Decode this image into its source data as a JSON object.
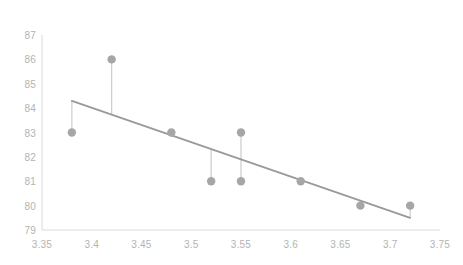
{
  "chart_data": {
    "type": "scatter",
    "title": "",
    "subtitle": "",
    "xlabel": "",
    "ylabel": "",
    "xlim": [
      3.35,
      3.75
    ],
    "ylim": [
      79,
      87
    ],
    "xticks": [
      "3.35",
      "3.4",
      "3.45",
      "3.5",
      "3.55",
      "3.6",
      "3.65",
      "3.7",
      "3.75"
    ],
    "xtick_values": [
      3.35,
      3.4,
      3.45,
      3.5,
      3.55,
      3.6,
      3.65,
      3.7,
      3.75
    ],
    "yticks": [
      "87",
      "86",
      "85",
      "84",
      "83",
      "82",
      "81",
      "80",
      "79"
    ],
    "ytick_values": [
      87,
      86,
      85,
      84,
      83,
      82,
      81,
      80,
      79
    ],
    "grid": false,
    "legend": "none",
    "series": [
      {
        "name": "data-points",
        "marker": "circle",
        "color": "#a6a6a6",
        "x": [
          3.38,
          3.42,
          3.48,
          3.52,
          3.55,
          3.55,
          3.61,
          3.67,
          3.72
        ],
        "y": [
          83,
          86,
          83,
          81,
          83,
          81,
          81,
          80,
          80
        ],
        "points": [
          {
            "x": 3.38,
            "y": 83
          },
          {
            "x": 3.42,
            "y": 86
          },
          {
            "x": 3.48,
            "y": 83
          },
          {
            "x": 3.52,
            "y": 81
          },
          {
            "x": 3.55,
            "y": 83
          },
          {
            "x": 3.55,
            "y": 81
          },
          {
            "x": 3.61,
            "y": 81
          },
          {
            "x": 3.67,
            "y": 80
          },
          {
            "x": 3.72,
            "y": 80
          }
        ]
      }
    ],
    "trendline": {
      "name": "linear-trendline",
      "type": "line",
      "color": "#999999",
      "x": [
        3.38,
        3.72
      ],
      "y": [
        84.3,
        79.5
      ],
      "slope": -14.12,
      "intercept": 131.99
    },
    "residual_lines": {
      "name": "residual-drop-lines",
      "color": "#cccccc",
      "segments": [
        {
          "x": 3.38,
          "y_point": 83,
          "y_fit": 84.3
        },
        {
          "x": 3.42,
          "y_point": 86,
          "y_fit": 83.73
        },
        {
          "x": 3.48,
          "y_point": 83,
          "y_fit": 82.89
        },
        {
          "x": 3.52,
          "y_point": 81,
          "y_fit": 82.32
        },
        {
          "x": 3.55,
          "y_point": 83,
          "y_fit": 81.9
        },
        {
          "x": 3.55,
          "y_point": 81,
          "y_fit": 81.9
        },
        {
          "x": 3.61,
          "y_point": 81,
          "y_fit": 81.05
        },
        {
          "x": 3.67,
          "y_point": 80,
          "y_fit": 80.21
        },
        {
          "x": 3.72,
          "y_point": 80,
          "y_fit": 79.5
        }
      ]
    },
    "axes": {
      "y_axis_color": "#d9d9d9",
      "x_axis_color": "#d9d9d9",
      "tick_label_color": "#b3b3b3"
    },
    "plot_area": {
      "left": 42,
      "right": 440,
      "top": 35,
      "bottom": 230
    }
  }
}
